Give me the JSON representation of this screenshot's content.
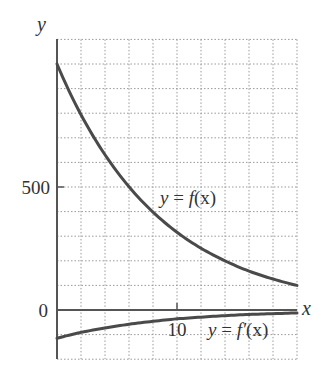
{
  "chart_data": {
    "type": "line",
    "title": "",
    "xlabel": "x",
    "ylabel": "y",
    "xlim": [
      0,
      20
    ],
    "ylim": [
      -200,
      1100
    ],
    "grid": true,
    "grid_x_step": 2,
    "grid_y_step": 100,
    "x_ticks": [
      {
        "value": 10,
        "label": "10"
      }
    ],
    "y_ticks": [
      {
        "value": 0,
        "label": "0"
      },
      {
        "value": 500,
        "label": "500"
      }
    ],
    "legend": null,
    "series": [
      {
        "name": "y = f(x)",
        "label": "y = f(x)",
        "x": [
          0,
          2,
          4,
          6,
          8,
          10,
          12,
          14,
          16,
          18,
          20
        ],
        "values": [
          1000,
          794,
          631,
          501,
          398,
          316,
          251,
          200,
          158,
          126,
          100
        ]
      },
      {
        "name": "y = f'(x)",
        "label": "y = f′(x)",
        "x": [
          0,
          2,
          4,
          6,
          8,
          10,
          12,
          14,
          16,
          18,
          20
        ],
        "values": [
          -115,
          -91,
          -73,
          -58,
          -46,
          -36,
          -29,
          -23,
          -18,
          -15,
          -12
        ]
      }
    ],
    "annotations": [
      {
        "text": "y = f(x)",
        "x": 11.2,
        "y": 470
      },
      {
        "text": "y = f′(x)",
        "x": 15.3,
        "y": -80
      }
    ]
  },
  "labels": {
    "y_axis": "y",
    "x_axis": "x",
    "tick_500": "500",
    "tick_0": "0",
    "tick_10": "10",
    "f_label_y": "y",
    "f_label_eq": " = ",
    "f_label_fn": "f",
    "f_label_arg": "(x)",
    "fp_label_y": "y",
    "fp_label_eq": " = ",
    "fp_label_fn": "f′",
    "fp_label_arg": "(x)"
  },
  "colors": {
    "curve": "#4a4a4a",
    "axis": "#555555",
    "grid": "#9a9a9a",
    "text": "#333333"
  }
}
